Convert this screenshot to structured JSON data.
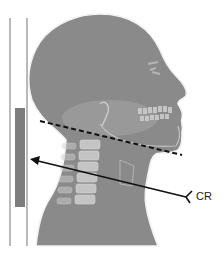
{
  "figure": {
    "type": "radiographic-positioning-diagram",
    "view": "lateral cervical spine",
    "labels": {
      "central_ray": "CR"
    },
    "elements": {
      "image_receptor": "vertical receptor with detector strip",
      "central_ray_arrow": "horizontal-angled arrow pointing toward receptor",
      "dashed_line": "mandible-to-occiput alignment line"
    },
    "colors": {
      "silhouette": "#8a8a8a",
      "silhouette_outline": "#f2f2f2",
      "bone_highlight": "#d8d8d8",
      "receptor_line": "#8c8c8c",
      "detector_strip": "#7d7d7d",
      "arrow": "#111111",
      "dashed_line": "#111111",
      "background": "#ffffff"
    }
  }
}
